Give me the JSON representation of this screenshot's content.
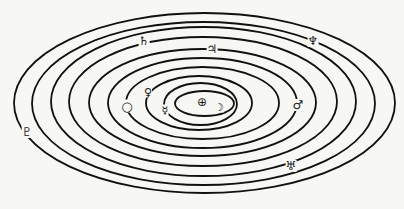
{
  "diagram": {
    "type": "concentric-orbits",
    "stroke_color": "#111111",
    "background": "#f7f7f5",
    "stroke_width": 1.8,
    "center": {
      "symbol": "⊕",
      "x": 202,
      "y": 102,
      "size": 12
    },
    "orbits": [
      {
        "cx": 204.5,
        "cy": 103.5,
        "rx": 29.5,
        "ry": 12.5
      },
      {
        "cx": 200.5,
        "cy": 104.0,
        "rx": 36.5,
        "ry": 21.0
      },
      {
        "cx": 199.0,
        "cy": 103.0,
        "rx": 53.0,
        "ry": 27.0
      },
      {
        "cx": 202.5,
        "cy": 103.0,
        "rx": 76.5,
        "ry": 36.0
      },
      {
        "cx": 202.5,
        "cy": 103.0,
        "rx": 94.5,
        "ry": 45.0
      },
      {
        "cx": 202.5,
        "cy": 102.5,
        "rx": 113.5,
        "ry": 53.5
      },
      {
        "cx": 203.0,
        "cy": 101.5,
        "rx": 134.0,
        "ry": 64.5
      },
      {
        "cx": 203.5,
        "cy": 101.5,
        "rx": 152.5,
        "ry": 74.5
      },
      {
        "cx": 203.5,
        "cy": 103.5,
        "rx": 171.5,
        "ry": 81.5
      },
      {
        "cx": 204.5,
        "cy": 103.0,
        "rx": 190.5,
        "ry": 90.0
      }
    ],
    "bodies": [
      {
        "name": "moon",
        "symbol": "☽",
        "x": 219,
        "y": 107,
        "size": 11
      },
      {
        "name": "mercury",
        "symbol": "☿",
        "x": 165,
        "y": 110,
        "size": 11
      },
      {
        "name": "venus",
        "symbol": "♀",
        "x": 148,
        "y": 92,
        "size": 11
      },
      {
        "name": "earth",
        "symbol": "○",
        "x": 127,
        "y": 106,
        "size": 13
      },
      {
        "name": "mars",
        "symbol": "♂",
        "x": 298,
        "y": 105,
        "size": 12
      },
      {
        "name": "jupiter",
        "symbol": "♃",
        "x": 212,
        "y": 49,
        "size": 12
      },
      {
        "name": "saturn",
        "symbol": "♄",
        "x": 144,
        "y": 41,
        "size": 12
      },
      {
        "name": "uranus",
        "symbol": "♅",
        "x": 291,
        "y": 166,
        "size": 12
      },
      {
        "name": "neptune",
        "symbol": "♆",
        "x": 313,
        "y": 41,
        "size": 12
      },
      {
        "name": "pluto",
        "symbol": "♇",
        "x": 27,
        "y": 132,
        "size": 12
      }
    ]
  }
}
